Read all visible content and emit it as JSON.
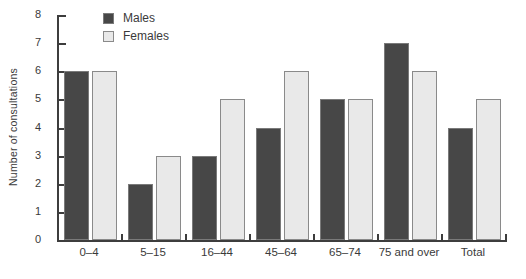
{
  "chart_data": {
    "type": "bar",
    "title": "",
    "xlabel": "",
    "ylabel": "Number of consultations",
    "ylim": [
      0,
      8
    ],
    "ytick_step": 1,
    "grid": false,
    "legend_position": "top-left-inside",
    "categories": [
      "0–4",
      "5–15",
      "16–44",
      "45–64",
      "65–74",
      "75 and over",
      "Total"
    ],
    "series": [
      {
        "name": "Males",
        "values": [
          6,
          2,
          3,
          4,
          5,
          7,
          4
        ],
        "fill": "#474747",
        "border": "#7a7a7a"
      },
      {
        "name": "Females",
        "values": [
          6,
          3,
          5,
          6,
          5,
          6,
          5
        ],
        "fill": "#e9e9e9",
        "border": "#8a8a8a"
      }
    ]
  },
  "colors": {
    "axis": "#3d3d3d",
    "text": "#3a3a3a",
    "background": "#ffffff"
  }
}
